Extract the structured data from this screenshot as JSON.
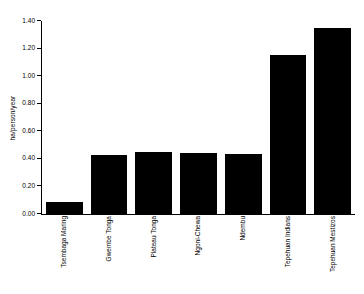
{
  "chart_data": {
    "type": "bar",
    "title": "",
    "xlabel": "",
    "ylabel": "ha/person/year",
    "categories": [
      "Tsembaga Maring",
      "Gwembe Tonga",
      "Plateau Tonga",
      "Ngoni-Chewa",
      "Ndembu",
      "Tepehuan Indians",
      "Tepehuan Mestizos"
    ],
    "values": [
      0.09,
      0.425,
      0.45,
      0.44,
      0.435,
      1.15,
      1.35
    ],
    "ylim": [
      0.0,
      1.4
    ],
    "ytick_labels": [
      "0.00",
      "0.20",
      "0.40",
      "0.60",
      "0.80",
      "1.00",
      "1.20",
      "1.40"
    ],
    "ytick_values": [
      0.0,
      0.2,
      0.4,
      0.6,
      0.8,
      1.0,
      1.2,
      1.4
    ],
    "grid": false,
    "legend": false,
    "bar_color": "#000000",
    "background_color": "#ffffff",
    "axis_color": "#000000"
  }
}
